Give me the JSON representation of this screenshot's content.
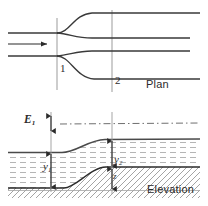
{
  "figure": {
    "background": "#ffffff",
    "width": 208,
    "height": 206
  },
  "colors": {
    "line": "#2b2b2b",
    "wall": "#3a3a3a",
    "section_line": "#8a8a8a",
    "energy_line": "#6f6f6f",
    "water_hatch": "#b9b9b9",
    "bed_hatch": "#9a9a9a",
    "text": "#2b2b2b"
  },
  "plan_view": {
    "name": "Plan",
    "label_x": 146,
    "label_y": 84,
    "flow_arrow": {
      "name": "flow-direction-arrow",
      "x1": 8,
      "y1": 44,
      "x2": 48,
      "y2": 44
    },
    "sections": [
      {
        "id": "1",
        "label": "1",
        "x": 57,
        "label_x": 60,
        "label_y": 68,
        "line_top": 18,
        "line_bottom": 90
      },
      {
        "id": "2",
        "label": "2",
        "x": 112,
        "label_x": 115,
        "label_y": 80,
        "line_top": 10,
        "line_bottom": 92
      }
    ],
    "upstream_walls": [
      {
        "name": "upper-approach-wall",
        "y": 33,
        "x_start": 8,
        "x_end": 57
      },
      {
        "name": "lower-approach-wall",
        "y": 56,
        "x_start": 8,
        "x_end": 57
      }
    ],
    "downstream_walls": [
      {
        "name": "outer-upper-wall",
        "y": 13,
        "x_start": 57,
        "x_end": 200
      },
      {
        "name": "inner-upper-wall",
        "y": 38,
        "x_start": 57,
        "x_end": 190
      },
      {
        "name": "inner-lower-wall",
        "y": 51,
        "x_start": 57,
        "x_end": 190
      },
      {
        "name": "outer-lower-wall",
        "y": 79,
        "x_start": 57,
        "x_end": 200
      }
    ]
  },
  "elevation_view": {
    "name": "Elevation",
    "label_x": 147,
    "label_y": 189,
    "energy_line": {
      "name": "energy-grade-line",
      "y": 124,
      "x_start": 62,
      "x_end": 200,
      "style": "dash-dot"
    },
    "datum_line": {
      "name": "datum-line",
      "y": 190,
      "x_start": 8,
      "x_end": 200
    },
    "water_surface": {
      "upstream_y": 152,
      "downstream_y": 139,
      "x_start": 8,
      "x_end": 200,
      "transition_start": 62,
      "transition_end": 105
    },
    "bed_profile": {
      "upstream_y": 188,
      "downstream_y": 167,
      "x_start": 8,
      "x_end": 200,
      "transition_start": 62,
      "transition_end": 112
    },
    "dimensions": [
      {
        "id": "E1",
        "name": "specific-energy-dimension",
        "label": "E",
        "subscript": "1",
        "label_x": 24,
        "label_y": 119,
        "arrow_x": 51,
        "arrow_top": 113,
        "arrow_bottom": 133
      },
      {
        "id": "y1",
        "name": "upstream-depth-dimension",
        "label": "y",
        "subscript": "1",
        "label_x": 44,
        "label_y": 166,
        "arrow_x": 51,
        "arrow_top": 152,
        "arrow_bottom": 188
      },
      {
        "id": "y2",
        "name": "downstream-depth-dimension",
        "label": "y",
        "subscript": "2",
        "label_x": 114,
        "label_y": 159,
        "arrow_x": 112,
        "arrow_top": 139,
        "arrow_bottom": 167
      },
      {
        "id": "z",
        "name": "bed-rise-dimension",
        "label": "z",
        "subscript": "",
        "label_x": 114,
        "label_y": 177,
        "arrow_x": 112,
        "arrow_top": 167,
        "arrow_bottom": 190
      }
    ],
    "section_lines": [
      {
        "id": "1",
        "x": 51,
        "y_top": 113,
        "y_bottom": 192
      },
      {
        "id": "2",
        "x": 112,
        "y_top": 113,
        "y_bottom": 192
      }
    ]
  }
}
